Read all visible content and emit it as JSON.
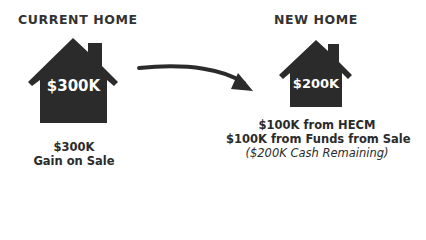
{
  "current_home": {
    "heading": "CURRENT HOME",
    "house_value": "$300K",
    "caption": {
      "amount": "$300K",
      "label": "Gain on Sale"
    }
  },
  "new_home": {
    "heading": "NEW HOME",
    "house_value": "$200K",
    "caption": {
      "line1_amount": "$100K from ",
      "line1_source": "HECM",
      "line2_amount": "$100K from ",
      "line2_source": "Funds from Sale",
      "line3": "($200K Cash Remaining)"
    }
  },
  "colors": {
    "house_fill": "#2b2b2b",
    "text": "#2b2b2b",
    "background": "#ffffff"
  },
  "icons": {
    "current_house": "house-icon",
    "new_house": "house-icon",
    "transition_arrow": "curved-arrow-icon"
  }
}
